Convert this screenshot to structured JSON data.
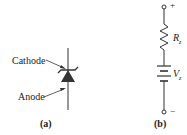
{
  "figure_a": {
    "cathode_label": "Cathode",
    "anode_label": "Anode",
    "caption": "(a)"
  },
  "figure_b": {
    "plus_label": "+",
    "minus_label": "−",
    "resistor_label": "R",
    "resistor_sub": "z",
    "source_label": "V",
    "source_sub": "z",
    "caption": "(b)"
  },
  "colors": {
    "line": "#333333",
    "text": "#222222"
  }
}
